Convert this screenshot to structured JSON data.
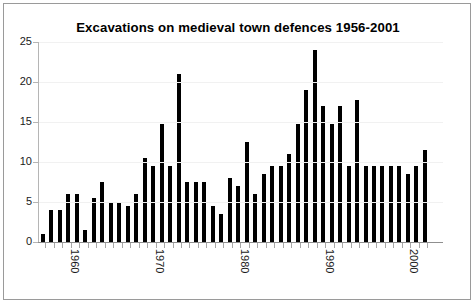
{
  "chart_data": {
    "type": "bar",
    "title": "Excavations on medieval town defences 1956-2001",
    "xlabel": "",
    "ylabel": "",
    "ylim": [
      0,
      25
    ],
    "ytick_values": [
      0,
      5,
      10,
      15,
      20,
      25
    ],
    "ytick_labels": [
      "0",
      "5",
      "10",
      "15",
      "20",
      "25"
    ],
    "xtick_labels": [
      "1960",
      "1970",
      "1980",
      "1990",
      "2000"
    ],
    "xtick_categories": [
      "1960",
      "1970",
      "1980",
      "1990",
      "2000"
    ],
    "grid": false,
    "legend": null,
    "bar_color": "#000000",
    "categories": [
      "1956",
      "1957",
      "1958",
      "1959",
      "1960",
      "1961",
      "1962",
      "1963",
      "1964",
      "1965",
      "1966",
      "1967",
      "1968",
      "1969",
      "1970",
      "1971",
      "1972",
      "1973",
      "1974",
      "1975",
      "1976",
      "1977",
      "1978",
      "1979",
      "1980",
      "1981",
      "1982",
      "1983",
      "1984",
      "1985",
      "1986",
      "1987",
      "1988",
      "1989",
      "1990",
      "1991",
      "1992",
      "1993",
      "1994",
      "1995",
      "1996",
      "1997",
      "1998",
      "1999",
      "2000",
      "2001"
    ],
    "values": [
      1,
      4,
      4,
      6,
      6,
      1.5,
      5.5,
      7.5,
      5,
      5,
      4.5,
      6,
      10.5,
      9.5,
      14.8,
      9.5,
      21,
      7.5,
      7.5,
      7.5,
      4.5,
      3.5,
      8,
      7,
      12.5,
      6,
      8.5,
      9.5,
      9.5,
      11,
      14.8,
      19,
      24,
      17,
      14.8,
      17,
      9.5,
      17.8,
      9.5,
      9.5,
      9.5,
      9.5,
      9.5,
      8.5,
      9.5,
      11.5
    ]
  },
  "figure": {
    "frame_color": "#9a9a9a",
    "background": "#ffffff",
    "axis_color": "#8f8f8f"
  }
}
